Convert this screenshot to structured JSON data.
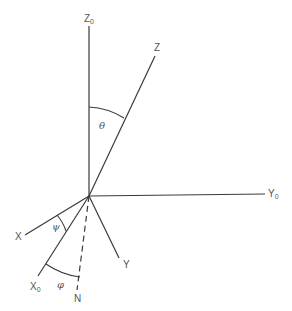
{
  "diagram": {
    "origin": [
      89,
      196
    ],
    "axes": {
      "z0": {
        "label": "Z",
        "subscript": "0",
        "end": [
          89,
          26
        ]
      },
      "z": {
        "label": "Z",
        "subscript": "",
        "end": [
          155,
          56
        ]
      },
      "y0": {
        "label": "Y",
        "subscript": "0",
        "end": [
          265,
          194
        ]
      },
      "y": {
        "label": "Y",
        "subscript": "",
        "end": [
          119,
          258
        ]
      },
      "x": {
        "label": "X",
        "subscript": "",
        "end": [
          25,
          235
        ]
      },
      "x0": {
        "label": "X",
        "subscript": "0",
        "end": [
          38,
          276
        ]
      },
      "n": {
        "label": "N",
        "subscript": "",
        "end": [
          77,
          290
        ],
        "style": "dashed"
      }
    },
    "angles": {
      "theta": {
        "symbol": "θ",
        "between": [
          "Z0",
          "Z"
        ]
      },
      "psi": {
        "symbol": "ψ",
        "between": [
          "X",
          "X0"
        ]
      },
      "phi": {
        "symbol": "φ",
        "between": [
          "X0",
          "N"
        ]
      }
    },
    "colors": {
      "line": "#3a3a3a",
      "text": "#555555",
      "background": "#ffffff"
    }
  }
}
